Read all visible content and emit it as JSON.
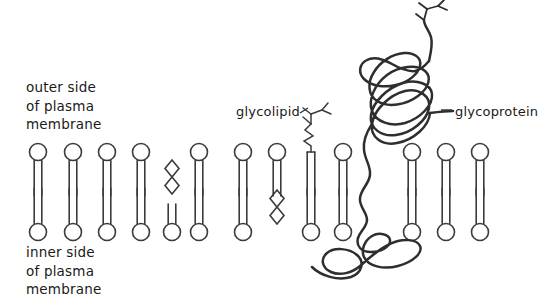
{
  "diagram": {
    "background_color": "#ffffff",
    "stroke_color": "#3b3b3b",
    "text_color": "#1a1a1a"
  },
  "labels": {
    "outer_side": {
      "name": "outer side of plasma membrane",
      "line1": "outer side",
      "line2": "of plasma",
      "line3": "membrane"
    },
    "inner_side": {
      "name": "inner side of plasma membrane",
      "line1": "inner side",
      "line2": "of plasma",
      "line3": "membrane"
    },
    "glycolipid": "glycolipid",
    "glycoprotein": "glycoprotein"
  },
  "structures": {
    "phospholipid": {
      "label": "phospholipid",
      "description": "circular head group with two parallel fatty acid tails"
    },
    "cholesterol": {
      "label": "cholesterol",
      "description": "double diamond ring zigzag"
    },
    "glycolipid": {
      "label": "glycolipid",
      "description": "lipid tails with zigzag stalk and branched sugar chain on outer side"
    },
    "glycoprotein": {
      "label": "glycoprotein",
      "description": "coiled polypeptide chain spanning the bilayer with branched sugar chain on outer side"
    }
  },
  "outer_leaflet": {
    "phospholipid_x": [
      38,
      73,
      107,
      141,
      199,
      243,
      277,
      343,
      412,
      446,
      480
    ],
    "cholesterol_x": [
      172
    ],
    "glycolipid_x": [
      311
    ],
    "head_center_y": 152,
    "tail_end_y": 196
  },
  "inner_leaflet": {
    "phospholipid_x": [
      38,
      73,
      107,
      141,
      172,
      199,
      243,
      311,
      343,
      412,
      446,
      480
    ],
    "cholesterol_x": [
      277
    ],
    "head_center_y": 232,
    "tail_start_y": 188
  }
}
